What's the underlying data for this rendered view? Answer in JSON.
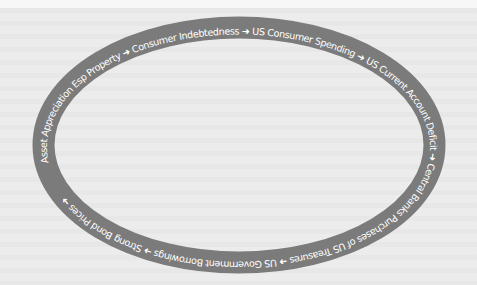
{
  "diagram": {
    "type": "cycle",
    "shape": "ellipse-ring",
    "colors": {
      "background": "#ececec",
      "ring": "#7b7b7b",
      "text": "#ffffff"
    },
    "arrow_glyph": "➜",
    "steps": [
      "Asset Appreciation Esp Property",
      "Consumer Indebtedness",
      "US Consumer Spending",
      "US Current Account Deficit",
      "Central Banks Purchases of US Treasures",
      "US Government Borrowings",
      "Strong Bond Prices"
    ],
    "ring_text": "Asset Appreciation Esp Property ➜ Consumer Indebtedness ➜ US Consumer Spending ➜ US Current Account Deficit ➜ Central Banks Purchases of US Treasures ➜ US Government Borrowings ➜ Strong Bond Prices ➜"
  }
}
